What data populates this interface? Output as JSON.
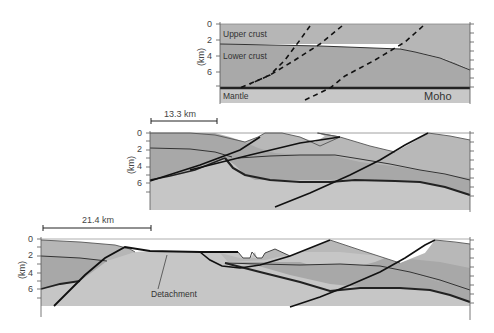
{
  "panel_top": {
    "axis_label": "(km)",
    "ticks": [
      "0",
      "2",
      "4",
      "6"
    ],
    "labels": {
      "upper_crust": "Upper crust",
      "lower_crust": "Lower crust",
      "mantle": "Mantle",
      "moho": "Moho"
    }
  },
  "panel_middle": {
    "axis_label": "(km)",
    "ticks": [
      "0",
      "2",
      "4",
      "6"
    ],
    "scale_bar": "13.3 km"
  },
  "panel_bottom": {
    "axis_label": "(km)",
    "ticks": [
      "0",
      "2",
      "4",
      "6"
    ],
    "scale_bar": "21.4 km",
    "annotation": "Detachment"
  },
  "colors": {
    "upper_crust": "#b4b4b4",
    "lower_crust": "#a8a8a8",
    "mantle": "#c6c6c6",
    "line": "#222222"
  }
}
